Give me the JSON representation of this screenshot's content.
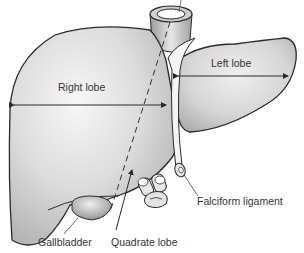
{
  "diagram": {
    "labels": {
      "right_lobe": "Right lobe",
      "left_lobe": "Left lobe",
      "gallbladder": "Gallbladder",
      "quadrate_lobe": "Quadrate lobe",
      "falciform_ligament": "Falciform ligament"
    },
    "colors": {
      "organ_fill": "#d9d9d9",
      "organ_highlight": "#f2f2f2",
      "outline": "#2a2a2a",
      "label_text": "#333333",
      "leader_line": "#444444"
    }
  }
}
